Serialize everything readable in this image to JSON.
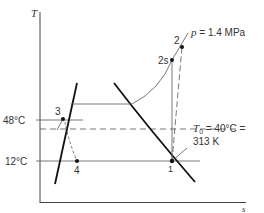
{
  "diagram": {
    "type": "T-s diagram (refrigeration cycle)",
    "axes": {
      "y_label": "T",
      "x_label": "s"
    },
    "temperature_ticks": [
      {
        "label": "48°C"
      },
      {
        "label": "12°C"
      }
    ],
    "ambient": {
      "label_line1": "T",
      "label_sub": "0",
      "label_rest1": " = 40°C =",
      "label_line2": "313 K"
    },
    "pressure_label": {
      "italic": "p",
      "rest": " = 1.4 MPa"
    },
    "states": [
      {
        "id": "1",
        "label": "1"
      },
      {
        "id": "2",
        "label": "2"
      },
      {
        "id": "2s",
        "label": "2s"
      },
      {
        "id": "3",
        "label": "3"
      },
      {
        "id": "4",
        "label": "4"
      }
    ],
    "colors": {
      "line": "#111111",
      "thin_line": "#555555",
      "text": "#333333"
    }
  }
}
